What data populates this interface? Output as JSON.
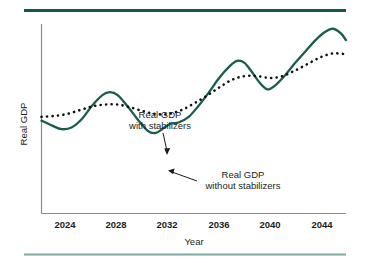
{
  "chart_data": {
    "type": "line",
    "title": "",
    "xlabel": "Year",
    "ylabel": "Real GDP",
    "xlim": [
      2022,
      2046
    ],
    "ylim": [
      0,
      100
    ],
    "grid": false,
    "legend_position": "inline-annotations",
    "xticks": [
      2024,
      2028,
      2032,
      2036,
      2040,
      2044
    ],
    "xtick_labels": [
      "2024",
      "2028",
      "2032",
      "2036",
      "2040",
      "2044"
    ],
    "yticks": [],
    "ytick_labels": [],
    "series": [
      {
        "name": "Real GDP without stabilizers",
        "style": "solid",
        "color": "#1a5c52",
        "x": [
          2022.0,
          2022.8,
          2023.6,
          2024.4,
          2025.2,
          2026.0,
          2026.8,
          2027.4,
          2028.0,
          2028.8,
          2029.6,
          2030.4,
          2031.0,
          2031.6,
          2032.2,
          2032.8,
          2033.6,
          2034.4,
          2035.2,
          2036.0,
          2036.8,
          2037.4,
          2038.0,
          2038.6,
          2039.2,
          2039.8,
          2040.4,
          2041.2,
          2042.0,
          2042.8,
          2043.6,
          2044.4,
          2045.0,
          2045.6,
          2046.0
        ],
        "y": [
          49.0,
          46.5,
          44.5,
          45.5,
          50.0,
          57.0,
          62.5,
          64.0,
          62.5,
          56.5,
          49.5,
          43.5,
          42.5,
          45.0,
          47.5,
          48.0,
          51.0,
          57.0,
          64.0,
          71.5,
          77.5,
          80.5,
          79.5,
          74.5,
          69.0,
          65.5,
          67.5,
          73.0,
          79.5,
          85.5,
          91.5,
          96.0,
          97.5,
          95.0,
          91.5
        ]
      },
      {
        "name": "Real GDP with stabilizers",
        "style": "dotted",
        "color": "#111111",
        "x": [
          2022.0,
          2023.0,
          2024.0,
          2025.0,
          2026.0,
          2027.0,
          2028.0,
          2029.0,
          2030.0,
          2031.0,
          2032.0,
          2033.0,
          2034.0,
          2035.0,
          2036.0,
          2037.0,
          2038.0,
          2039.0,
          2040.0,
          2041.0,
          2042.0,
          2043.0,
          2044.0,
          2045.0,
          2046.0
        ],
        "y": [
          51.0,
          51.5,
          52.5,
          54.5,
          56.5,
          57.5,
          57.5,
          56.0,
          54.0,
          52.5,
          52.5,
          54.5,
          58.0,
          62.0,
          66.5,
          70.5,
          72.5,
          72.5,
          71.5,
          72.5,
          75.5,
          79.0,
          82.5,
          84.5,
          84.0
        ]
      }
    ],
    "annotations": [
      {
        "name": "annotation-with-stabilizers",
        "lines": [
          "Real GDP",
          "with stabilizers"
        ],
        "text_x": 160,
        "text_y": 119,
        "arrow_from_x": 160,
        "arrow_from_y": 126,
        "arrow_to_x": 166,
        "arrow_to_y": 154
      },
      {
        "name": "annotation-without-stabilizers",
        "lines": [
          "Real GDP",
          "without stabilizers"
        ],
        "text_x": 243,
        "text_y": 180,
        "arrow_from_x": 198,
        "arrow_from_y": 183,
        "arrow_to_x": 168,
        "arrow_to_y": 170
      }
    ]
  },
  "decor": {
    "top_rule_color": "#12574d",
    "bottom_rule_color": "#7fa9a3",
    "axis_color": "#8a8a8a"
  }
}
